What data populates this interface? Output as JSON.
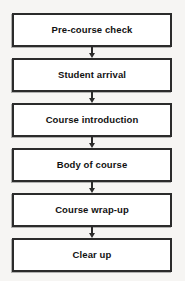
{
  "diagram": {
    "orientation": "vertical",
    "background_color": "#f6f5f3",
    "box_fill_color": "#ffffff",
    "border_color": "#2b2b2b",
    "text_color": "#111111",
    "nodes": [
      {
        "id": "pre-course-check",
        "label": "Pre-course check"
      },
      {
        "id": "student-arrival",
        "label": "Student arrival"
      },
      {
        "id": "course-introduction",
        "label": "Course introduction"
      },
      {
        "id": "body-of-course",
        "label": "Body of course"
      },
      {
        "id": "course-wrap-up",
        "label": "Course wrap-up"
      },
      {
        "id": "clear-up",
        "label": "Clear up"
      }
    ],
    "connectors": [
      {
        "from": "pre-course-check",
        "to": "student-arrival",
        "icon": "arrow-down-icon"
      },
      {
        "from": "student-arrival",
        "to": "course-introduction",
        "icon": "arrow-down-icon"
      },
      {
        "from": "course-introduction",
        "to": "body-of-course",
        "icon": "arrow-down-icon"
      },
      {
        "from": "body-of-course",
        "to": "course-wrap-up",
        "icon": "arrow-down-icon"
      },
      {
        "from": "course-wrap-up",
        "to": "clear-up",
        "icon": "arrow-down-icon"
      }
    ]
  }
}
